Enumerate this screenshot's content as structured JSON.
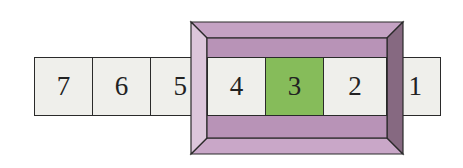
{
  "diagram": {
    "cells": [
      {
        "label": "7",
        "x": 34,
        "w": 58,
        "highlighted": false
      },
      {
        "label": "6",
        "x": 92,
        "w": 58,
        "highlighted": false
      },
      {
        "label": "5",
        "x": 150,
        "w": 58,
        "highlighted": false
      },
      {
        "label": "4",
        "x": 207,
        "w": 58,
        "highlighted": false
      },
      {
        "label": "3",
        "x": 265,
        "w": 58,
        "highlighted": true
      },
      {
        "label": "2",
        "x": 323,
        "w": 64,
        "highlighted": false
      },
      {
        "label": "1",
        "x": 400,
        "w": 41,
        "highlighted": false
      }
    ],
    "window": {
      "outer": {
        "x": 191,
        "y": 22,
        "w": 212,
        "h": 132
      },
      "inner": {
        "x": 207,
        "y": 38,
        "w": 180,
        "h": 100
      }
    },
    "colors": {
      "cell_fill": "#efefeb",
      "highlight_fill": "#86bc5a",
      "frame_top": "#b994b8",
      "frame_inner_band": "#b48fb3",
      "frame_left": "#d9c0d8",
      "frame_right": "#85677f",
      "frame_bottom": "#c5a3c4",
      "outline": "#2a2a2a"
    }
  }
}
